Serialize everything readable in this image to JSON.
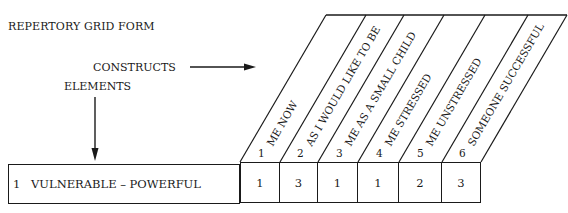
{
  "form": {
    "title": "REPERTORY GRID FORM",
    "constructs_label": "CONSTRUCTS",
    "elements_label": "ELEMENTS"
  },
  "columns": [
    {
      "number": "1",
      "label": "ME NOW"
    },
    {
      "number": "2",
      "label": "AS I WOULD LIKE TO BE"
    },
    {
      "number": "3",
      "label": "ME AS A SMALL CHILD"
    },
    {
      "number": "4",
      "label": "ME STRESSED"
    },
    {
      "number": "5",
      "label": "ME UNSTRESSED"
    },
    {
      "number": "6",
      "label": "SOMEONE SUCCESSFUL"
    }
  ],
  "rows": [
    {
      "number": "1",
      "label": "VULNERABLE – POWERFUL",
      "ratings": [
        "1",
        "3",
        "1",
        "1",
        "2",
        "3"
      ]
    }
  ],
  "colors": {
    "ink": "#1a1a1a",
    "background": "#ffffff"
  }
}
